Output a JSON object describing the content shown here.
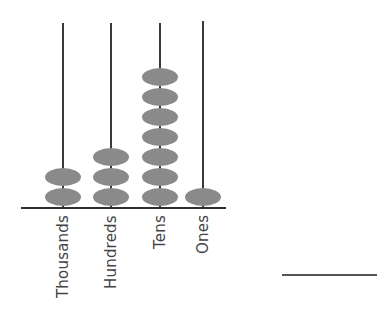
{
  "abacus": {
    "columns": [
      {
        "label": "Thousands",
        "beads": 2,
        "rod_x": 63,
        "rod_top": 23
      },
      {
        "label": "Hundreds",
        "beads": 3,
        "rod_x": 111,
        "rod_top": 23
      },
      {
        "label": "Tens",
        "beads": 7,
        "rod_x": 160,
        "rod_top": 23
      },
      {
        "label": "Ones",
        "beads": 1,
        "rod_x": 203,
        "rod_top": 21
      }
    ],
    "base_y": 207,
    "bead_color": "#8a8a8a",
    "rod_color": "#3a3a3a"
  },
  "answer": {
    "blank": ""
  }
}
